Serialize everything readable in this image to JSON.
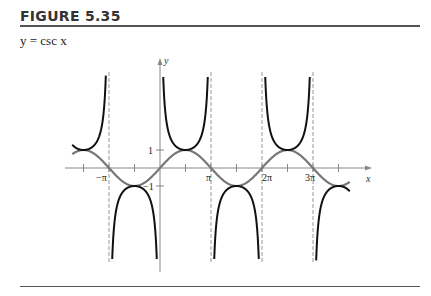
{
  "figure": {
    "label": "FIGURE 5.35",
    "caption": "y = csc x"
  },
  "chart_data": {
    "type": "line",
    "title": "y = csc x",
    "xlabel": "x",
    "ylabel": "y",
    "x_tick_labels": [
      "−π",
      "π",
      "2π",
      "3π"
    ],
    "y_tick_labels": [
      "1",
      "−1"
    ],
    "series": [
      {
        "name": "y = csc x",
        "style": "thick black",
        "function": "csc(x)"
      },
      {
        "name": "y = sin x",
        "style": "gray reference",
        "function": "sin(x)"
      }
    ],
    "asymptotes": [
      "−π",
      "0",
      "π",
      "2π",
      "3π"
    ],
    "xlim": [
      -1.7,
      3.7
    ],
    "xlim_units": "π",
    "ylim": [
      -5,
      5
    ],
    "grid": false,
    "legend": null
  },
  "axes": {
    "x_label": "x",
    "y_label": "y",
    "ticks": {
      "neg_pi": "−π",
      "pi": "π",
      "two_pi": "2π",
      "three_pi": "3π",
      "one": "1",
      "neg_one": "−1"
    }
  }
}
